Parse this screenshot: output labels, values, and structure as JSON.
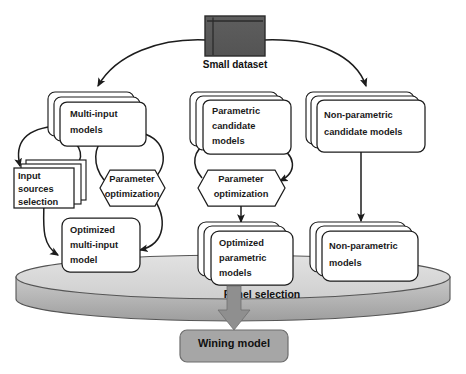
{
  "diagram": {
    "colors": {
      "dataset_fill": "#595959",
      "dataset_stroke": "#2b2b2b",
      "panel_top_fill": "#d9d9d9",
      "panel_side_fill": "#a6a6a6",
      "winning_fill": "#a6a6a6",
      "arrow_gray": "#8f8f8f",
      "line": "#1c1c1c",
      "box_fill": "#ffffff",
      "text": "#1a1a1a"
    },
    "nodes": {
      "small_dataset": {
        "label": "Small dataset",
        "shape": "dataset-icon"
      },
      "multi_input_models": {
        "label_lines": [
          "Multi-input",
          "models"
        ],
        "shape": "stacked-rounded-rect",
        "stack": 3
      },
      "parametric_candidate_models": {
        "label_lines": [
          "Parametric",
          "candidate",
          "models"
        ],
        "shape": "stacked-rounded-rect",
        "stack": 3
      },
      "nonparametric_candidate_models": {
        "label_lines": [
          "Non-parametric",
          "candidate models"
        ],
        "shape": "stacked-rounded-rect",
        "stack": 3
      },
      "input_sources_selection": {
        "label_lines": [
          "Input",
          "sources",
          "selection"
        ],
        "shape": "stacked-rect",
        "stack": 3
      },
      "parameter_optimization_left": {
        "label_lines": [
          "Parameter",
          "optimization"
        ],
        "shape": "hexagon"
      },
      "parameter_optimization_mid": {
        "label_lines": [
          "Parameter",
          "optimization"
        ],
        "shape": "hexagon"
      },
      "optimized_multi_input_model": {
        "label_lines": [
          "Optimized",
          "multi-input",
          "model"
        ],
        "shape": "rounded-rect"
      },
      "optimized_parametric_models": {
        "label_lines": [
          "Optimized",
          "parametric",
          "models"
        ],
        "shape": "stacked-rounded-rect",
        "stack": 3
      },
      "nonparametric_models": {
        "label_lines": [
          "Non-parametric",
          "models"
        ],
        "shape": "stacked-rounded-rect",
        "stack": 3
      },
      "panel_selection": {
        "label": "Panel selection",
        "shape": "cylinder-platter"
      },
      "winning_model": {
        "label": "Wining model",
        "shape": "rounded-rect-filled"
      }
    },
    "edges": [
      {
        "from": "small_dataset",
        "to": "multi_input_models",
        "style": "curved-arrow"
      },
      {
        "from": "small_dataset",
        "to": "nonparametric_candidate_models",
        "style": "curved-arrow"
      },
      {
        "from": "multi_input_models",
        "to": "input_sources_selection",
        "style": "curved-arrow"
      },
      {
        "from": "input_sources_selection",
        "to": "multi_input_models",
        "style": "curved-arrow"
      },
      {
        "from": "multi_input_models",
        "to": "parameter_optimization_left",
        "style": "curved-arrow"
      },
      {
        "from": "parameter_optimization_left",
        "to": "multi_input_models",
        "style": "curved-arrow"
      },
      {
        "from": "input_sources_selection",
        "to": "optimized_multi_input_model",
        "style": "curved-arrow"
      },
      {
        "from": "parameter_optimization_left",
        "to": "optimized_multi_input_model",
        "style": "curved-arrow"
      },
      {
        "from": "parametric_candidate_models",
        "to": "parameter_optimization_mid",
        "style": "curved-arrow"
      },
      {
        "from": "parameter_optimization_mid",
        "to": "parametric_candidate_models",
        "style": "curved-arrow"
      },
      {
        "from": "parameter_optimization_mid",
        "to": "optimized_parametric_models",
        "style": "straight-arrow"
      },
      {
        "from": "nonparametric_candidate_models",
        "to": "nonparametric_models",
        "style": "straight-arrow"
      },
      {
        "from": "panel_selection",
        "to": "winning_model",
        "style": "thick-gray-arrow"
      }
    ]
  }
}
